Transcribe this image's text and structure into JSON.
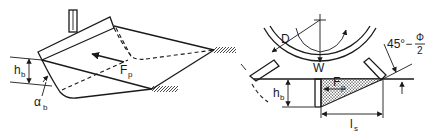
{
  "diagram": {
    "left_view": {
      "labels": {
        "height": "h",
        "height_sub": "b",
        "angle": "α",
        "angle_sub": "b",
        "force": "F",
        "force_sub": "p"
      }
    },
    "right_view": {
      "labels": {
        "diameter": "D",
        "weight": "W",
        "force": "F",
        "force_sub": "p",
        "height": "h",
        "height_sub": "b",
        "length": "l",
        "length_sub": "s",
        "angle_expr": "45°−",
        "phi_num": "Φ",
        "phi_den": "2"
      }
    }
  }
}
